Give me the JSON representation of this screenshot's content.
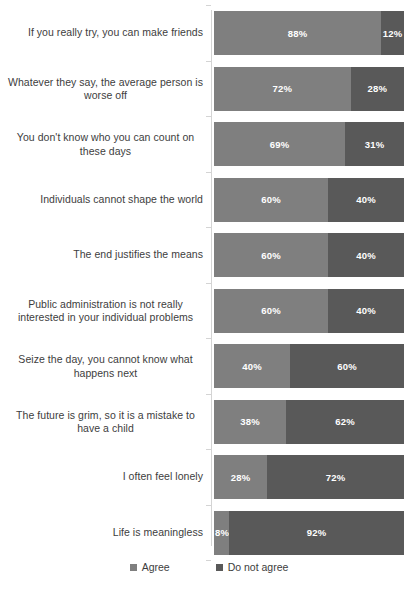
{
  "chart_data": {
    "type": "bar",
    "subtype": "stacked-horizontal-100pct",
    "title": "",
    "xlabel": "",
    "ylabel": "",
    "xlim": [
      0,
      100
    ],
    "grid": false,
    "legend_position": "bottom",
    "orientation": "horizontal",
    "stacked": true,
    "categories": [
      "If you really try, you can make friends",
      "Whatever they say, the average person is worse off",
      "You don't know who you can count on these days",
      "Individuals cannot shape the world",
      "The end justifies the means",
      "Public administration is not really interested in your individual problems",
      "Seize the day, you cannot know what happens next",
      "The future is grim, so it is a mistake to have a child",
      "I often feel lonely",
      "Life is meaningless"
    ],
    "series": [
      {
        "name": "Agree",
        "color": "#7f7f7f",
        "values": [
          88,
          72,
          69,
          60,
          60,
          60,
          40,
          38,
          28,
          8
        ],
        "labels": [
          "88%",
          "72%",
          "69%",
          "60%",
          "60%",
          "60%",
          "40%",
          "38%",
          "28%",
          "8%"
        ]
      },
      {
        "name": "Do not agree",
        "color": "#595959",
        "values": [
          12,
          28,
          31,
          40,
          40,
          40,
          60,
          62,
          72,
          92
        ],
        "labels": [
          "12%",
          "28%",
          "31%",
          "40%",
          "40%",
          "40%",
          "60%",
          "62%",
          "72%",
          "92%"
        ]
      }
    ]
  },
  "legend": {
    "items": [
      {
        "label": "Agree",
        "color": "#7f7f7f"
      },
      {
        "label": "Do not agree",
        "color": "#595959"
      }
    ]
  },
  "rows": [
    {
      "label": "If you really try, you can make friends",
      "two_line": false,
      "agree": 88,
      "disagree": 12,
      "agree_label": "88%",
      "disagree_label": "12%"
    },
    {
      "label": "Whatever they say, the average person is worse off",
      "two_line": true,
      "agree": 72,
      "disagree": 28,
      "agree_label": "72%",
      "disagree_label": "28%"
    },
    {
      "label": "You don't know who you can count on these days",
      "two_line": true,
      "agree": 69,
      "disagree": 31,
      "agree_label": "69%",
      "disagree_label": "31%"
    },
    {
      "label": "Individuals cannot shape the world",
      "two_line": false,
      "agree": 60,
      "disagree": 40,
      "agree_label": "60%",
      "disagree_label": "40%"
    },
    {
      "label": "The end justifies the means",
      "two_line": false,
      "agree": 60,
      "disagree": 40,
      "agree_label": "60%",
      "disagree_label": "40%"
    },
    {
      "label": "Public administration is not really interested in your individual problems",
      "two_line": true,
      "agree": 60,
      "disagree": 40,
      "agree_label": "60%",
      "disagree_label": "40%"
    },
    {
      "label": "Seize the day, you cannot know what happens next",
      "two_line": true,
      "agree": 40,
      "disagree": 60,
      "agree_label": "40%",
      "disagree_label": "60%"
    },
    {
      "label": "The future is grim, so it is a mistake to have a child",
      "two_line": true,
      "agree": 38,
      "disagree": 62,
      "agree_label": "38%",
      "disagree_label": "62%"
    },
    {
      "label": "I often feel lonely",
      "two_line": false,
      "agree": 28,
      "disagree": 72,
      "agree_label": "28%",
      "disagree_label": "72%"
    },
    {
      "label": "Life is meaningless",
      "two_line": false,
      "agree": 8,
      "disagree": 92,
      "agree_label": "8%",
      "disagree_label": "92%"
    }
  ]
}
